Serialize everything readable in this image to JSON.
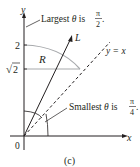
{
  "figure": {
    "caption": "(c)",
    "axis_labels": {
      "x": "x",
      "y": "y",
      "origin": "0"
    },
    "y_ticks": {
      "two": "2",
      "sqrt2_radical": "√",
      "sqrt2_value": "2"
    },
    "region_label": "R",
    "ray_label": "L",
    "line_label": "y = x",
    "annotation_top": {
      "prefix": "Largest ",
      "theta": "θ",
      "is": " is ",
      "num": "π",
      "den": "2",
      "end": "."
    },
    "annotation_bottom": {
      "prefix": "Smallest ",
      "theta": "θ",
      "is": " is ",
      "num": "π",
      "den": "4",
      "end": "."
    },
    "colors": {
      "ink": "#231f20",
      "region_boundary": "#a7a9ac"
    }
  }
}
